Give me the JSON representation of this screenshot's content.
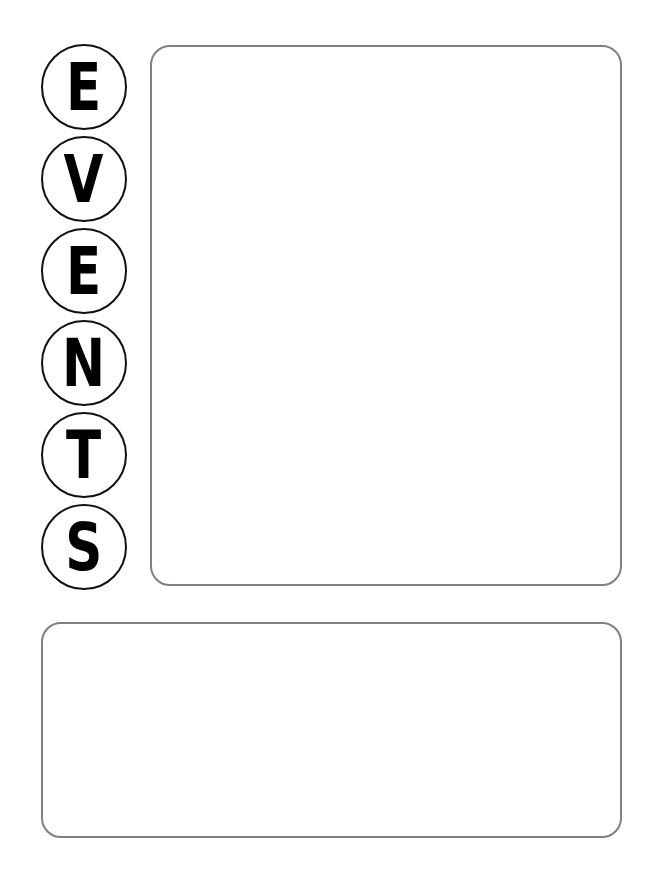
{
  "title": {
    "letters": [
      "E",
      "V",
      "E",
      "N",
      "T",
      "S"
    ],
    "word": "EVENTS"
  },
  "layout": {
    "circle_border_color": "#111111",
    "box_border_color": "#808080",
    "background": "#ffffff"
  },
  "main_box": {
    "content": ""
  },
  "bottom_box": {
    "content": ""
  }
}
